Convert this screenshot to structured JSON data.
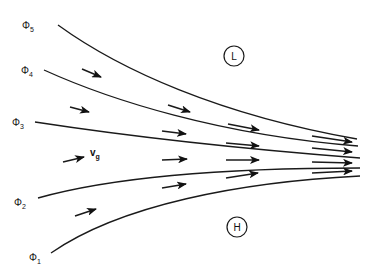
{
  "diagram": {
    "isobars": [
      {
        "label": "Φ",
        "sub": "5",
        "lx": 30,
        "ly": 25,
        "path": "M58,25 C120,70 220,115 357,139"
      },
      {
        "label": "Φ",
        "sub": "4",
        "lx": 29,
        "ly": 70,
        "path": "M44,70 C110,100 220,135 358,146"
      },
      {
        "label": "Φ",
        "sub": "3",
        "lx": 20,
        "ly": 122,
        "path": "M35,122 C120,135 230,148 360,158"
      },
      {
        "label": "Φ",
        "sub": "2",
        "lx": 22,
        "ly": 202,
        "path": "M38,198 C120,175 240,168 360,168"
      },
      {
        "label": "Φ",
        "sub": "1",
        "lx": 37,
        "ly": 257,
        "path": "M51,253 C120,205 240,182 360,176"
      }
    ],
    "pressure_centers": [
      {
        "label": "L",
        "cx": 234,
        "cy": 56,
        "r": 10
      },
      {
        "label": "H",
        "cx": 237,
        "cy": 227,
        "r": 10
      }
    ],
    "velocity_label": {
      "text": "v",
      "sub": "g",
      "x": 90,
      "y": 156
    },
    "arrows": [
      {
        "x1": 82,
        "y1": 69,
        "x2": 101,
        "y2": 77
      },
      {
        "x1": 70,
        "y1": 107,
        "x2": 89,
        "y2": 112
      },
      {
        "x1": 63,
        "y1": 162,
        "x2": 84,
        "y2": 157
      },
      {
        "x1": 75,
        "y1": 216,
        "x2": 96,
        "y2": 209
      },
      {
        "x1": 168,
        "y1": 105,
        "x2": 190,
        "y2": 112
      },
      {
        "x1": 162,
        "y1": 131,
        "x2": 186,
        "y2": 134
      },
      {
        "x1": 162,
        "y1": 160,
        "x2": 187,
        "y2": 159
      },
      {
        "x1": 162,
        "y1": 188,
        "x2": 186,
        "y2": 184
      },
      {
        "x1": 228,
        "y1": 124,
        "x2": 259,
        "y2": 130
      },
      {
        "x1": 226,
        "y1": 143,
        "x2": 259,
        "y2": 146
      },
      {
        "x1": 226,
        "y1": 160,
        "x2": 259,
        "y2": 160
      },
      {
        "x1": 226,
        "y1": 178,
        "x2": 258,
        "y2": 173
      },
      {
        "x1": 312,
        "y1": 136,
        "x2": 352,
        "y2": 142
      },
      {
        "x1": 312,
        "y1": 148,
        "x2": 352,
        "y2": 152
      },
      {
        "x1": 312,
        "y1": 162,
        "x2": 352,
        "y2": 163
      },
      {
        "x1": 312,
        "y1": 173,
        "x2": 352,
        "y2": 171
      }
    ],
    "colors": {
      "line": "#1a1a1a",
      "background": "#ffffff"
    }
  }
}
